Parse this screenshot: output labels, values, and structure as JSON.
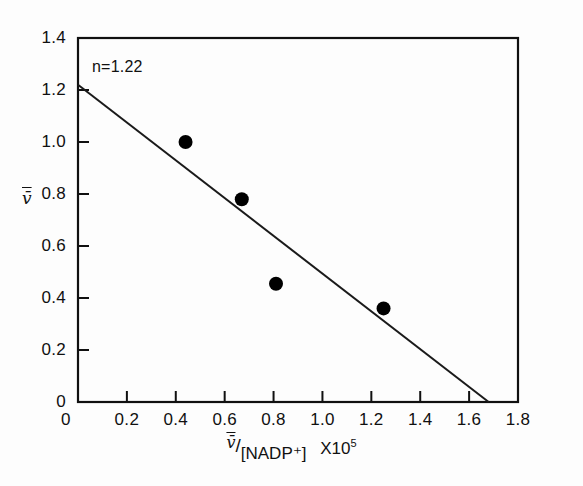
{
  "chart_data": {
    "type": "scatter",
    "title": "",
    "xlabel": "v̄/[NADP⁺] X10⁵",
    "ylabel": "v̄",
    "xlim": [
      0,
      1.8
    ],
    "ylim": [
      0,
      1.4
    ],
    "grid": false,
    "legend": "none",
    "x_ticks": [
      "0",
      "0.2",
      "0.4",
      "0.6",
      "0.8",
      "1.0",
      "1.2",
      "1.4",
      "1.6",
      "1.8"
    ],
    "x_tick_values": [
      0,
      0.2,
      0.4,
      0.6,
      0.8,
      1.0,
      1.2,
      1.4,
      1.6,
      1.8
    ],
    "y_ticks": [
      "0",
      "0.2",
      "0.4",
      "0.6",
      "0.8",
      "1.0",
      "1.2",
      "1.4"
    ],
    "y_tick_values": [
      0,
      0.2,
      0.4,
      0.6,
      0.8,
      1.0,
      1.2,
      1.4
    ],
    "points": [
      {
        "x": 0.44,
        "y": 1.0
      },
      {
        "x": 0.67,
        "y": 0.78
      },
      {
        "x": 0.81,
        "y": 0.455
      },
      {
        "x": 1.25,
        "y": 0.36
      }
    ],
    "series": [
      {
        "name": "binding data",
        "x": [
          0.44,
          0.67,
          0.81,
          1.25
        ],
        "values": [
          1.0,
          0.78,
          0.455,
          0.36
        ]
      },
      {
        "name": "fitted line",
        "x": [
          0.0,
          1.68
        ],
        "values": [
          1.22,
          0.0
        ]
      }
    ],
    "fit_line": {
      "y_intercept": 1.22,
      "x_intercept": 1.68,
      "slope": -0.7262
    },
    "annotations": [
      {
        "text": "n=1.22",
        "x": 0.06,
        "y": 1.3
      }
    ]
  },
  "axis_labels": {
    "y_title": "v̄",
    "x_numerator": "v̄",
    "x_slash": "/",
    "x_denominator": "[NADP⁺]",
    "x_multiplier_base": "X10",
    "x_multiplier_exp": "5"
  },
  "annotation": {
    "n_value_text": "n=1.22"
  },
  "style": {
    "axis_color": "#101010",
    "marker_color": "#000000",
    "line_color": "#1a1a1a",
    "background": "#fdfdfd"
  }
}
